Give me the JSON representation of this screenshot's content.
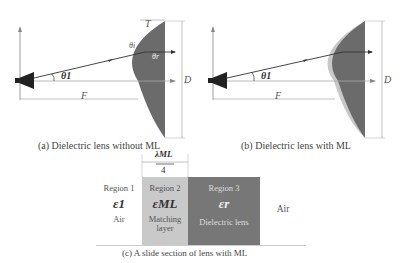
{
  "figure_a": {
    "caption": "(a) Dielectric lens without ML",
    "labels": {
      "T": "T",
      "theta_i": "θi",
      "theta_r": "θr",
      "theta_1": "θ1",
      "D": "D",
      "F": "F"
    },
    "colors": {
      "lens": "#6b6b6b",
      "feed": "#222222"
    }
  },
  "figure_b": {
    "caption": "(b) Dielectric lens with ML",
    "labels": {
      "theta_1": "θ1",
      "D": "D",
      "F": "F"
    },
    "colors": {
      "lens": "#6b6b6b",
      "matching_layer": "#c8c8c8",
      "feed": "#222222"
    }
  },
  "figure_c": {
    "caption": "(c) A slide section of lens with ML",
    "dimension_label_num": "λML",
    "dimension_label_den": "4",
    "regions": [
      {
        "name": "Region 1",
        "eps": "ε1",
        "desc": "Air",
        "color": "#ffffff"
      },
      {
        "name": "Region 2",
        "eps": "εML",
        "desc": "Matching layer",
        "color": "#c9c9c9"
      },
      {
        "name": "Region 3",
        "eps": "εr",
        "desc": "Dielectric lens",
        "color": "#777777"
      },
      {
        "name": "",
        "eps": "",
        "desc": "Air",
        "color": "#ffffff"
      }
    ]
  }
}
